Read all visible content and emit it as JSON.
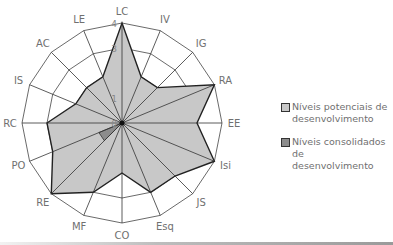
{
  "chart_data": {
    "type": "radar",
    "title": "",
    "axes": [
      "LC",
      "IV",
      "IG",
      "RA",
      "EE",
      "Isi",
      "JS",
      "Esq",
      "CO",
      "MF",
      "RE",
      "PO",
      "RC",
      "IS",
      "AC",
      "LE"
    ],
    "scale": {
      "min": 0,
      "max": 4,
      "ticks": [
        0,
        1,
        2,
        3,
        4
      ],
      "tick_labels_shown": [
        "0",
        "1",
        "3",
        "4"
      ]
    },
    "series": [
      {
        "name": "Níveis potenciais de desenvolvimento",
        "color": "#c8c8c8",
        "values": [
          4,
          2,
          2,
          4,
          3,
          4,
          3,
          3,
          2,
          3,
          4,
          3,
          3,
          2,
          2,
          2
        ]
      },
      {
        "name": "Níveis consolidados de desenvolvimento",
        "color": "#8c8c8c",
        "values": [
          0,
          0,
          0,
          0,
          0,
          0,
          0,
          0,
          0,
          0,
          1,
          1,
          0,
          0,
          0,
          0
        ]
      }
    ],
    "legend_position": "right"
  },
  "legend": {
    "items": [
      {
        "line1": "Níveis potenciais de",
        "line2": "desenvolvimento",
        "color": "#c8c8c8"
      },
      {
        "line1": "Níveis consolidados de",
        "line2": "desenvolvimento",
        "color": "#8c8c8c"
      }
    ]
  }
}
